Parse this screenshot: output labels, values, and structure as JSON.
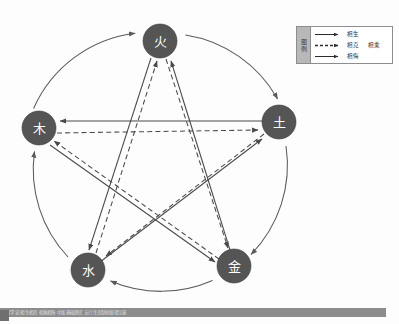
{
  "diagram": {
    "type": "five-elements-wuxing",
    "nodes": [
      {
        "id": "fire",
        "label": "火",
        "cx": 160,
        "cy": 41,
        "r": 17
      },
      {
        "id": "wood",
        "label": "木",
        "cx": 39,
        "cy": 128,
        "r": 17
      },
      {
        "id": "earth",
        "label": "土",
        "cx": 279,
        "cy": 122,
        "r": 17
      },
      {
        "id": "water",
        "label": "水",
        "cx": 88,
        "cy": 270,
        "r": 17
      },
      {
        "id": "metal",
        "label": "金",
        "cx": 234,
        "cy": 266,
        "r": 17
      }
    ],
    "outer_circle": {
      "cx": 159,
      "cy": 158,
      "r": 128
    },
    "generating_cycle": [
      "木",
      "火",
      "土",
      "金",
      "水",
      "木"
    ],
    "overcoming_cycle": [
      "木",
      "土",
      "水",
      "火",
      "金",
      "木"
    ],
    "edges_generating": [
      {
        "from": "wood",
        "to": "fire",
        "relation": "相生"
      },
      {
        "from": "fire",
        "to": "earth",
        "relation": "相生"
      },
      {
        "from": "earth",
        "to": "metal",
        "relation": "相生"
      },
      {
        "from": "metal",
        "to": "water",
        "relation": "相生"
      },
      {
        "from": "water",
        "to": "wood",
        "relation": "相生"
      }
    ],
    "edges_overcoming": [
      {
        "from": "wood",
        "to": "earth",
        "relation": "相克·相乘",
        "style": "dashed"
      },
      {
        "from": "earth",
        "to": "water",
        "relation": "相克·相乘",
        "style": "dashed"
      },
      {
        "from": "water",
        "to": "fire",
        "relation": "相克·相乘",
        "style": "dashed"
      },
      {
        "from": "fire",
        "to": "metal",
        "relation": "相克·相乘",
        "style": "dashed"
      },
      {
        "from": "metal",
        "to": "wood",
        "relation": "相克·相乘",
        "style": "dashed"
      }
    ],
    "edges_insulting": [
      {
        "from": "earth",
        "to": "wood",
        "relation": "相侮",
        "style": "solid"
      },
      {
        "from": "water",
        "to": "earth",
        "relation": "相侮",
        "style": "solid"
      },
      {
        "from": "fire",
        "to": "water",
        "relation": "相侮",
        "style": "solid"
      },
      {
        "from": "metal",
        "to": "fire",
        "relation": "相侮",
        "style": "solid"
      },
      {
        "from": "wood",
        "to": "metal",
        "relation": "相侮",
        "style": "solid"
      }
    ]
  },
  "legend": {
    "tab_label": "图例",
    "rows": [
      {
        "style": "solid",
        "label": "相生",
        "label2": ""
      },
      {
        "style": "dashed",
        "label": "相克",
        "label2": "相乘"
      },
      {
        "style": "solid",
        "label": "相侮",
        "label2": ""
      }
    ]
  },
  "bottom_bar": {
    "text": "五行学说 相生相克 相乘相侮 中医基础理论 五行生克制化规律示意"
  },
  "colors": {
    "node_fill": "#555555",
    "node_text": "#ffffff",
    "line": "#4a4a4a",
    "arc": "#5a5a5a",
    "legend_tab": "#b8b8b8",
    "bottom_bar": "#8c8c8c"
  }
}
